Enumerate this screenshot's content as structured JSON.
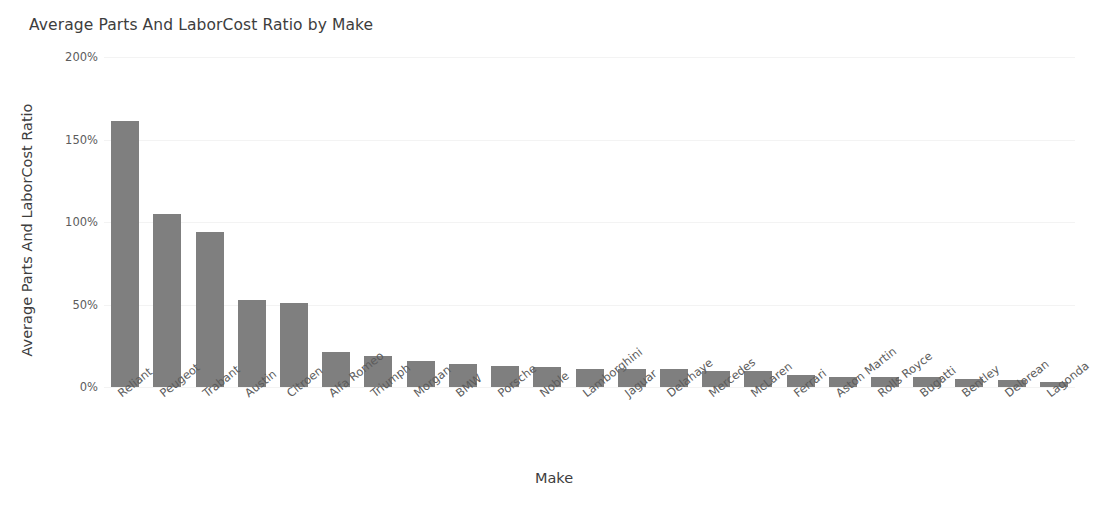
{
  "chart_data": {
    "type": "bar",
    "title": "Average Parts And LaborCost Ratio by Make",
    "xlabel": "Make",
    "ylabel": "Average Parts And LaborCost Ratio",
    "ylim": [
      0,
      200
    ],
    "y_unit": "%",
    "grid": true,
    "legend": "none",
    "bar_color": "#7f7f7f",
    "y_ticks": [
      {
        "value": 200,
        "label": "200%"
      },
      {
        "value": 150,
        "label": "150%"
      },
      {
        "value": 100,
        "label": "100%"
      },
      {
        "value": 50,
        "label": "50%"
      },
      {
        "value": 0,
        "label": "0%"
      }
    ],
    "categories": [
      "Reliant",
      "Peugeot",
      "Trabant",
      "Austin",
      "Citroen",
      "Alfa Romeo",
      "Triumph",
      "Morgan",
      "BMW",
      "Porsche",
      "Noble",
      "Lamborghini",
      "Jaguar",
      "Delahaye",
      "Mercedes",
      "McLaren",
      "Ferrari",
      "Aston Martin",
      "Rolls Royce",
      "Bugatti",
      "Bentley",
      "Delorean",
      "Lagonda"
    ],
    "values": [
      161,
      105,
      94,
      53,
      51,
      21,
      19,
      16,
      14,
      13,
      12,
      11,
      11,
      11,
      10,
      10,
      7,
      6,
      6,
      6,
      5,
      4,
      3
    ]
  }
}
